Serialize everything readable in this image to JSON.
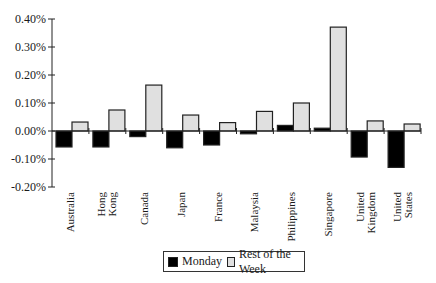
{
  "chart_data": {
    "type": "bar",
    "title": "",
    "xlabel": "",
    "ylabel": "",
    "ylim": [
      -0.2,
      0.4
    ],
    "yticks": [
      "0.40%",
      "0.30%",
      "0.20%",
      "0.10%",
      "0.00%",
      "-0.10%",
      "-0.20%"
    ],
    "grid": false,
    "legend_position": "bottom",
    "categories": [
      "Australia",
      "Hong Kong",
      "Canada",
      "Japan",
      "France",
      "Malaysia",
      "Philippines",
      "Singapore",
      "United Kingdom",
      "United States"
    ],
    "category_labels": [
      "Australia",
      "Hong\nKong",
      "Canada",
      "Japan",
      "France",
      "Malaysia",
      "Philippines",
      "Singapore",
      "United\nKingdom",
      "United\nStates"
    ],
    "series": [
      {
        "name": "Monday",
        "color": "#000000",
        "values": [
          -0.057,
          -0.057,
          -0.02,
          -0.06,
          -0.05,
          -0.01,
          0.02,
          0.01,
          -0.093,
          -0.13
        ]
      },
      {
        "name": "Rest of the Week",
        "color": "#e0e0e0",
        "values": [
          0.032,
          0.075,
          0.164,
          0.057,
          0.03,
          0.07,
          0.1,
          0.371,
          0.036,
          0.025
        ]
      }
    ],
    "unit": "%"
  },
  "legend": {
    "monday_label": "Monday",
    "rest_label": "Rest of the Week"
  }
}
